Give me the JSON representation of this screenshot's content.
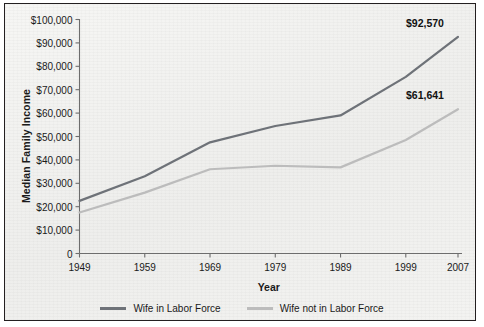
{
  "chart_data": {
    "type": "line",
    "title": "",
    "xlabel": "Year",
    "ylabel": "Median Family Income",
    "x": [
      1949,
      1959,
      1969,
      1979,
      1989,
      1999,
      2007
    ],
    "xtick_labels": [
      "1949",
      "1959",
      "1969",
      "1979",
      "1989",
      "1999",
      "2007"
    ],
    "ytick_labels": [
      "$100,000",
      "$90,000",
      "$80,000",
      "$70,000",
      "$60,000",
      "$50,000",
      "$40,000",
      "$30,000",
      "$20,000",
      "$10,000",
      "0"
    ],
    "ytick_values": [
      100000,
      90000,
      80000,
      70000,
      60000,
      50000,
      40000,
      30000,
      20000,
      10000,
      0
    ],
    "ylim": [
      0,
      100000
    ],
    "xlim": [
      1949,
      2007
    ],
    "grid": false,
    "legend_position": "bottom",
    "series": [
      {
        "name": "Wife in Labor Force",
        "color": "#6e7278",
        "values": [
          22500,
          33000,
          47500,
          54500,
          59000,
          75500,
          92570
        ],
        "end_label": "$92,570"
      },
      {
        "name": "Wife not in Labor Force",
        "color": "#bcbcbc",
        "values": [
          17500,
          26000,
          36000,
          37500,
          36800,
          48500,
          61641
        ],
        "end_label": "$61,641"
      }
    ],
    "annotations": [
      {
        "text": "$92,570",
        "series": "Wife in Labor Force",
        "x": 2007,
        "y": 92570
      },
      {
        "text": "$61,641",
        "series": "Wife not in Labor Force",
        "x": 2007,
        "y": 61641
      }
    ]
  },
  "axes": {
    "y_title": "Median Family Income",
    "x_title": "Year"
  },
  "legend": {
    "items": [
      {
        "label": "Wife in Labor Force",
        "color": "#6e7278"
      },
      {
        "label": "Wife not in Labor Force",
        "color": "#bcbcbc"
      }
    ]
  },
  "colors": {
    "border": "#231f20",
    "background": "#f2f2f0",
    "axis": "#6d6d6d",
    "text": "#1a1a1a"
  }
}
